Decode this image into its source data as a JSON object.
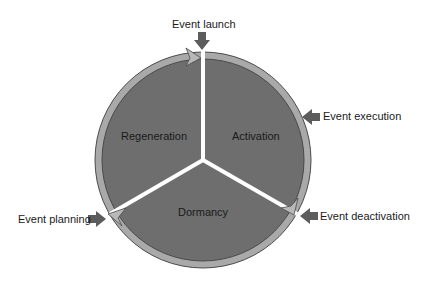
{
  "diagram": {
    "type": "cycle",
    "segments": [
      {
        "label": "Activation"
      },
      {
        "label": "Dormancy"
      },
      {
        "label": "Regeneration"
      }
    ],
    "events": [
      {
        "label": "Event launch"
      },
      {
        "label": "Event execution"
      },
      {
        "label": "Event deactivation"
      },
      {
        "label": "Event planning"
      }
    ],
    "colors": {
      "segment_fill": "#6e6e6e",
      "rim": "#a9a9a9",
      "rim_outline": "#4a4a4a",
      "divider": "#ffffff",
      "event_arrow": "#5c5c5c",
      "text": "#1a1a1a"
    }
  }
}
